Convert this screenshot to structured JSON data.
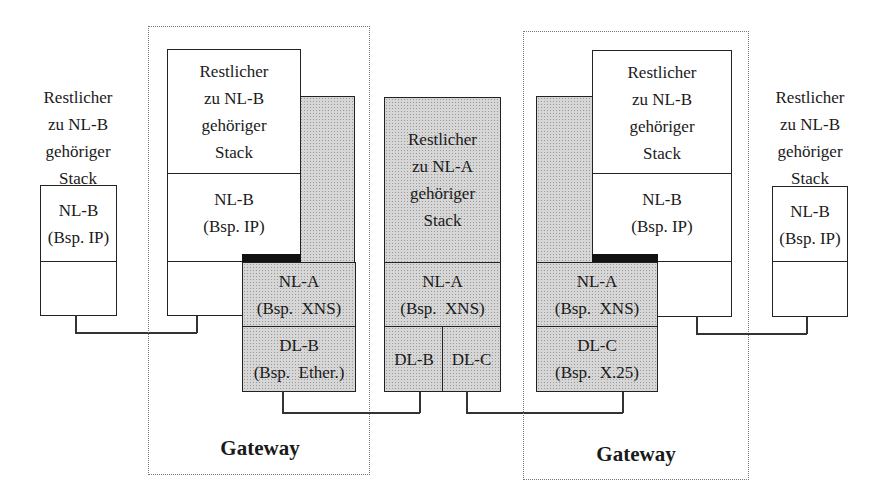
{
  "diagram": {
    "type": "protocol-stack-gateway",
    "left_host": {
      "stack_label": [
        "Restlicher",
        "zu NL-B",
        "gehöriger",
        "Stack"
      ],
      "nl_label": [
        "NL-B",
        "(Bsp. IP)"
      ]
    },
    "left_gateway": {
      "title": "Gateway",
      "stack_label": [
        "Restlicher",
        "zu NL-B",
        "gehöriger",
        "Stack"
      ],
      "nl_b_label": [
        "NL-B",
        "(Bsp. IP)"
      ],
      "nl_a_label": [
        "NL-A",
        "(Bsp.  XNS)"
      ],
      "dl_label": [
        "DL-B",
        "(Bsp.  Ether.)"
      ]
    },
    "center_node": {
      "stack_label": [
        "Restlicher",
        "zu NL-A",
        "gehöriger",
        "Stack"
      ],
      "nl_a_label": [
        "NL-A",
        "(Bsp.  XNS)"
      ],
      "dl_left": "DL-B",
      "dl_right": "DL-C"
    },
    "right_gateway": {
      "title": "Gateway",
      "stack_label": [
        "Restlicher",
        "zu NL-B",
        "gehöriger",
        "Stack"
      ],
      "nl_b_label": [
        "NL-B",
        "(Bsp. IP)"
      ],
      "nl_a_label": [
        "NL-A",
        "(Bsp.  XNS)"
      ],
      "dl_label": [
        "DL-C",
        "(Bsp.  X.25)"
      ]
    },
    "right_host": {
      "stack_label": [
        "Restlicher",
        "zu NL-B",
        "gehöriger",
        "Stack"
      ],
      "nl_label": [
        "NL-B",
        "(Bsp. IP)"
      ]
    },
    "colors": {
      "line": "#222222",
      "shade": "#d6d6d6",
      "black_bar": "#111111",
      "dotted_border": "#777777"
    }
  }
}
